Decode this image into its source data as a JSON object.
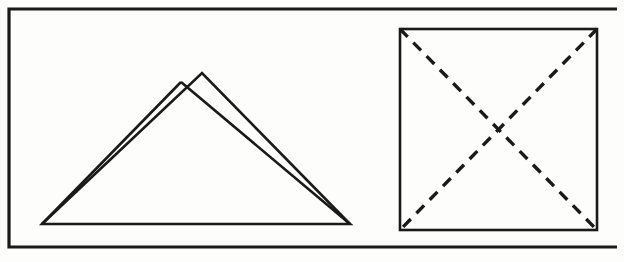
{
  "document": {
    "title": "Geometric Line Drawing",
    "kind": "scanned-line-figure",
    "background_color": "#fdfdfc",
    "ink_color": "#1a1a1a",
    "width": 624,
    "height": 262
  },
  "frame": {
    "name": "outer-border-rectangle",
    "x": 9,
    "y": 9,
    "width": 608,
    "height": 238,
    "stroke_width": 3.2,
    "style": "solid",
    "right_edge_visible": false
  },
  "figures": [
    {
      "id": "overlapping-triangles",
      "label": "Overlapping Triangles",
      "position": "left",
      "description": "Two large triangles sharing a common baseline and a common bottom-right vertex, with two distinct apex peaks creating an overlapping mountain silhouette.",
      "baseline": {
        "y": 224,
        "x_start": 42,
        "x_end": 350
      },
      "shapes": [
        {
          "id": "triangle-left",
          "name": "left-triangle",
          "points": "42,224 181,82 350,224",
          "apex": {
            "x": 181,
            "y": 82
          },
          "style": "solid"
        },
        {
          "id": "triangle-right",
          "name": "right-triangle",
          "points": "42,224 202,73 350,224",
          "apex": {
            "x": 202,
            "y": 73
          },
          "style": "solid",
          "visible_edges": "apex-to-bottom-right only plus short apex-to-left-slope segment"
        }
      ]
    },
    {
      "id": "square-with-diagonals",
      "label": "Square with Dashed Diagonals",
      "position": "right",
      "description": "A square outlined in solid stroke with both diagonals drawn as dashed lines, forming an X that meets at the square's center.",
      "square": {
        "name": "square-outline",
        "x": 400,
        "y": 29,
        "width": 197,
        "height": 201,
        "style": "solid"
      },
      "center": {
        "x": 498,
        "y": 130
      },
      "diagonals": [
        {
          "id": "diagonal-tl-br",
          "name": "diagonal-top-left-to-bottom-right",
          "from": {
            "x": 400,
            "y": 29
          },
          "to": {
            "x": 597,
            "y": 230
          },
          "style": "dashed",
          "dash_length": 11,
          "gap_length": 8
        },
        {
          "id": "diagonal-tr-bl",
          "name": "diagonal-top-right-to-bottom-left",
          "from": {
            "x": 597,
            "y": 29
          },
          "to": {
            "x": 400,
            "y": 230
          },
          "style": "dashed",
          "dash_length": 11,
          "gap_length": 8
        }
      ]
    }
  ]
}
